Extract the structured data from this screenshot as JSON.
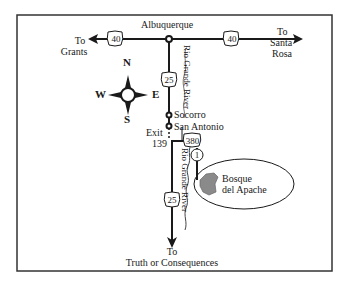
{
  "map": {
    "title": "Directions to Bosque del Apache",
    "colors": {
      "line": "#1a1a1a",
      "frame": "#333333",
      "refuge_fill": "#8a8a8a",
      "background": "#ffffff"
    },
    "cities": {
      "albuquerque": "Albuquerque",
      "socorro": "Socorro",
      "san_antonio": "San Antonio"
    },
    "destinations": {
      "west": {
        "line1": "To",
        "line2": "Grants"
      },
      "east": {
        "line1": "To",
        "line2": "Santa",
        "line3": "Rosa"
      },
      "south": {
        "line1": "To",
        "line2": "Truth or Consequences"
      }
    },
    "exit": {
      "line1": "Exit",
      "line2": "139"
    },
    "shields": {
      "i40_west": "40",
      "i40_east": "40",
      "i25_north": "25",
      "i25_south": "25",
      "us380": "380",
      "nm1": "1"
    },
    "rivers": {
      "north": "Rio Grande River",
      "south": "Rio Grande River"
    },
    "refuge": {
      "line1": "Bosque",
      "line2": "del Apache"
    },
    "compass": {
      "n": "N",
      "s": "S",
      "e": "E",
      "w": "W"
    }
  }
}
